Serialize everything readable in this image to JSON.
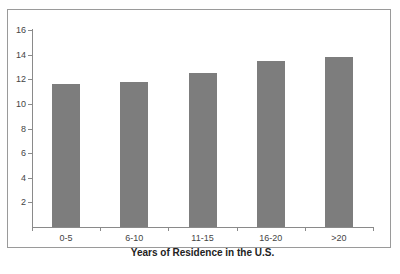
{
  "chart_data": {
    "type": "bar",
    "title": "",
    "xlabel": "Years of Residence in the U.S.",
    "ylabel": "",
    "categories": [
      "0-5",
      "6-10",
      "11-15",
      "16-20",
      ">20"
    ],
    "values": [
      11.6,
      11.8,
      12.5,
      13.5,
      13.8
    ],
    "ylim": [
      0,
      16
    ],
    "yticks": [
      2,
      4,
      6,
      8,
      10,
      12,
      14,
      16
    ],
    "grid": false,
    "legend": null,
    "bar_color": "#7d7d7d"
  }
}
